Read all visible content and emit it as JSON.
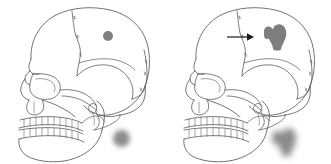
{
  "figure": {
    "background_color": "#ffffff",
    "width": 331,
    "height": 164,
    "panel_count": 2
  },
  "panels": [
    {
      "id": "panel-left",
      "name": "left-panel",
      "label": "",
      "skull": {
        "name": "lateral-skull-outline-left",
        "orientation": "left-facing lateral view",
        "stroke_color": "#5a5a5a",
        "fill_color": "#ffffff",
        "features": [
          "cranial vault",
          "coronal suture",
          "squamosal suture",
          "lambdoid suture",
          "orbit",
          "nasal aperture",
          "zygomatic arch",
          "maxillary teeth",
          "mandibular teeth",
          "mandible",
          "external auditory meatus"
        ]
      },
      "markers": [
        {
          "name": "parietal-dot-marker",
          "shape": "circle",
          "state": "sharp",
          "color": "#808080",
          "x": 103,
          "y": 31,
          "size": 10
        },
        {
          "name": "blurred-dot-marker",
          "shape": "circle",
          "state": "blurred",
          "color": "#8c8c8c",
          "x": 113,
          "y": 130,
          "size": 17
        }
      ],
      "arrow": null
    },
    {
      "id": "panel-right",
      "name": "right-panel",
      "label": "",
      "skull": {
        "name": "lateral-skull-outline-right",
        "orientation": "left-facing lateral view",
        "stroke_color": "#5a5a5a",
        "fill_color": "#ffffff",
        "features": [
          "cranial vault",
          "coronal suture",
          "squamosal suture",
          "lambdoid suture",
          "orbit",
          "nasal aperture",
          "zygomatic arch",
          "maxillary teeth",
          "mandibular teeth",
          "mandible",
          "external auditory meatus"
        ]
      },
      "markers": [
        {
          "name": "parietal-pin-marker",
          "shape": "pin",
          "state": "sharp",
          "color": "#7e7e7e",
          "x": 92,
          "y": 22,
          "size": 32
        },
        {
          "name": "blurred-pin-marker",
          "shape": "pin",
          "state": "blurred",
          "color": "#8a8a8a",
          "x": 100,
          "y": 126,
          "size": 34
        }
      ],
      "arrow": {
        "name": "pointer-arrow",
        "direction": "right",
        "color": "#1c1c1c",
        "x": 62,
        "y": 31,
        "length": 26
      }
    }
  ]
}
